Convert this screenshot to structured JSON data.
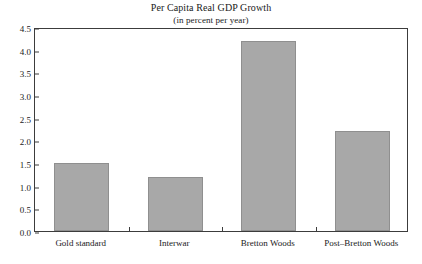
{
  "chart_data": {
    "type": "bar",
    "title": "Per Capita Real GDP Growth",
    "subtitle": "(in percent per year)",
    "xlabel": "",
    "ylabel": "",
    "categories": [
      "Gold standard",
      "Interwar",
      "Bretton Woods",
      "Post–Bretton Woods"
    ],
    "values": [
      1.5,
      1.2,
      4.2,
      2.2
    ],
    "ylim": [
      0.0,
      4.5
    ],
    "ytick_labels": [
      "0.0",
      "0.5",
      "1.0",
      "1.5",
      "2.0",
      "2.5",
      "3.0",
      "3.5",
      "4.0",
      "4.5"
    ],
    "ytick_values": [
      0.0,
      0.5,
      1.0,
      1.5,
      2.0,
      2.5,
      3.0,
      3.5,
      4.0,
      4.5
    ],
    "grid": false,
    "legend": false,
    "bar_color": "#a8a8a8",
    "bar_edge_color": "#8f8f8f",
    "frame_color": "#3c3c3c",
    "background": "#ffffff"
  }
}
